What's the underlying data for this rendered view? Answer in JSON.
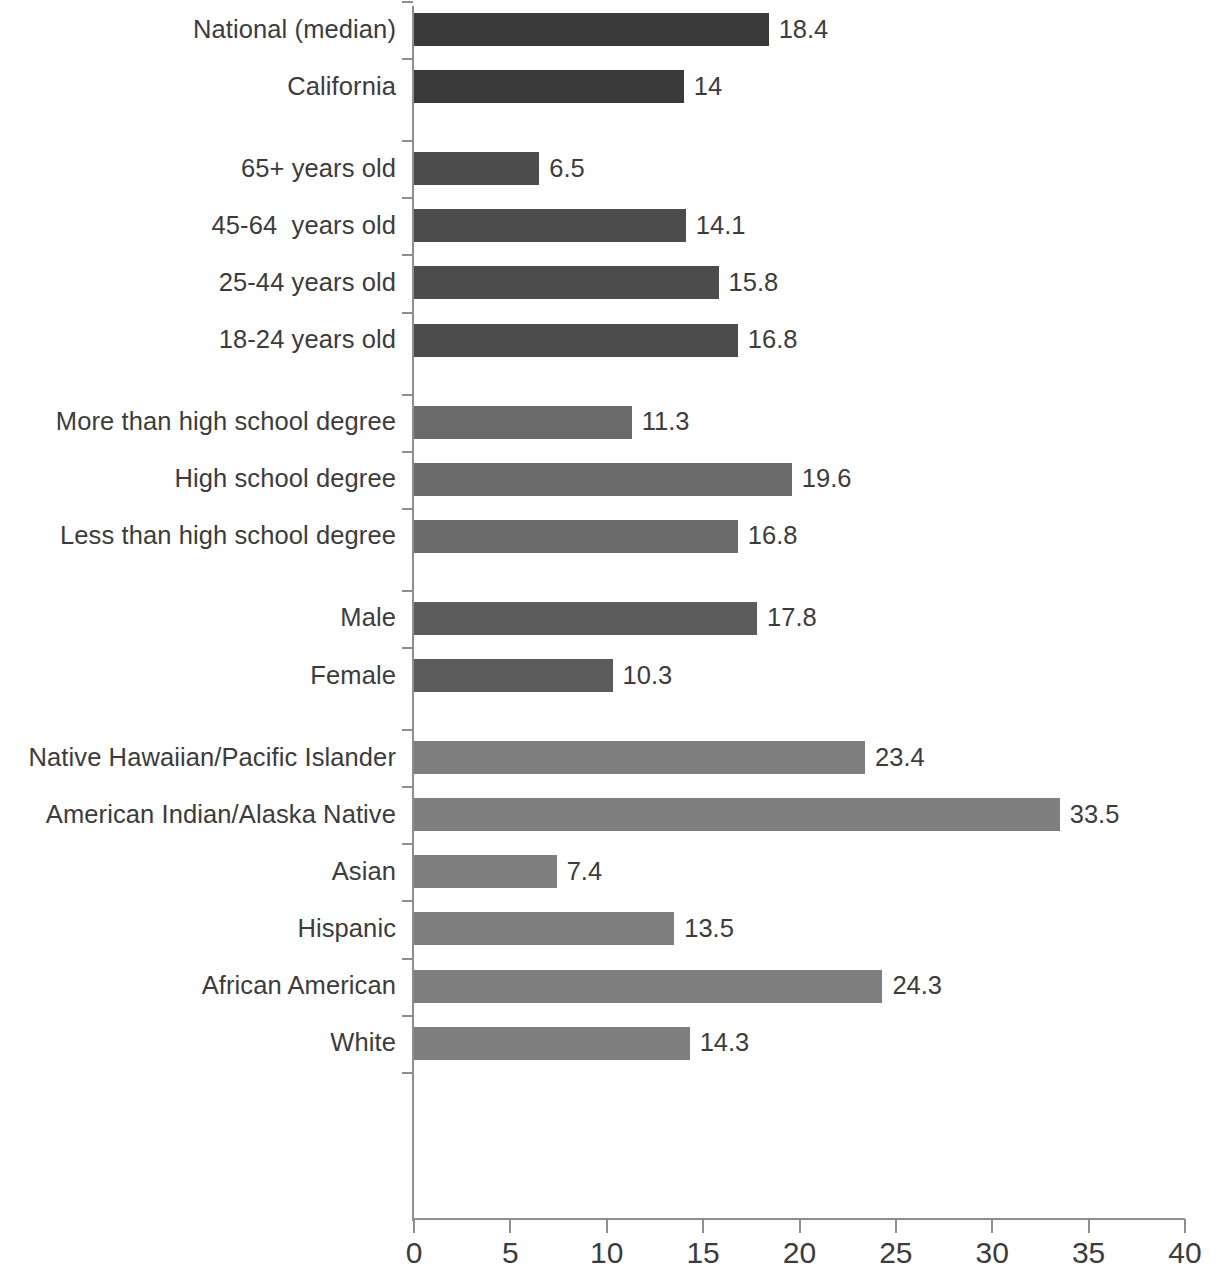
{
  "chart_data": {
    "type": "bar",
    "orientation": "horizontal",
    "title": "",
    "subtitle": "",
    "xlabel": "",
    "ylabel": "",
    "xlim": [
      0,
      40
    ],
    "xticks": [
      0,
      5,
      10,
      15,
      20,
      25,
      30,
      35,
      40
    ],
    "xtick_labels": [
      "0",
      "5",
      "10",
      "15",
      "20",
      "25",
      "30",
      "35",
      "40"
    ],
    "grid": false,
    "legend": null,
    "groups": [
      {
        "name": "benchmark",
        "color": "#3a3a3a",
        "categories": [
          "National (median)",
          "California"
        ],
        "values": [
          18.4,
          14
        ],
        "value_labels": [
          "18.4",
          "14"
        ]
      },
      {
        "name": "age",
        "color": "#4c4c4c",
        "categories": [
          "65+ years old",
          "45-64  years old",
          "25-44 years old",
          "18-24 years old"
        ],
        "values": [
          6.5,
          14.1,
          15.8,
          16.8
        ],
        "value_labels": [
          "6.5",
          "14.1",
          "15.8",
          "16.8"
        ]
      },
      {
        "name": "education",
        "color": "#6b6b6b",
        "categories": [
          "More than high school degree",
          "High school degree",
          "Less than high school degree"
        ],
        "values": [
          11.3,
          19.6,
          16.8
        ],
        "value_labels": [
          "11.3",
          "19.6",
          "16.8"
        ]
      },
      {
        "name": "gender",
        "color": "#5c5c5c",
        "categories": [
          "Male",
          "Female"
        ],
        "values": [
          17.8,
          10.3
        ],
        "value_labels": [
          "17.8",
          "10.3"
        ]
      },
      {
        "name": "race_ethnicity",
        "color": "#7f7f7f",
        "categories": [
          "Native Hawaiian/Pacific Islander",
          "American Indian/Alaska Native",
          "Asian",
          "Hispanic",
          "African American",
          "White"
        ],
        "values": [
          23.4,
          33.5,
          7.4,
          13.5,
          24.3,
          14.3
        ],
        "value_labels": [
          "23.4",
          "33.5",
          "7.4",
          "13.5",
          "24.3",
          "14.3"
        ]
      }
    ],
    "categories": [
      "National (median)",
      "California",
      "65+ years old",
      "45-64  years old",
      "25-44 years old",
      "18-24 years old",
      "More than high school degree",
      "High school degree",
      "Less than high school degree",
      "Male",
      "Female",
      "Native Hawaiian/Pacific Islander",
      "American Indian/Alaska Native",
      "Asian",
      "Hispanic",
      "African American",
      "White"
    ],
    "values": [
      18.4,
      14,
      6.5,
      14.1,
      15.8,
      16.8,
      11.3,
      19.6,
      16.8,
      17.8,
      10.3,
      23.4,
      33.5,
      7.4,
      13.5,
      24.3,
      14.3
    ]
  },
  "axis": {
    "tick_labels": [
      "0",
      "5",
      "10",
      "15",
      "20",
      "25",
      "30",
      "35",
      "40"
    ]
  }
}
